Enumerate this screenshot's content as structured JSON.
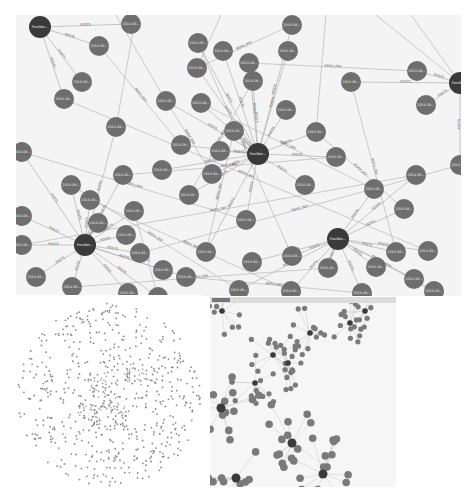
{
  "figure": {
    "colors": {
      "hub_node": "#3a3a3a",
      "leaf_node": "#6e6e6e",
      "edge": "#b8b8b8",
      "edge_label": "#555555",
      "node_label": "#e8e8e8",
      "background": "#f4f4f4"
    }
  },
  "top_panel": {
    "edge_labels": [
      "POSTS",
      "REPLY_REF"
    ],
    "hubs": [
      {
        "id": "h1",
        "label": "PostNat...",
        "x": 24,
        "y": 12,
        "r": 11
      },
      {
        "id": "h2",
        "label": "PostNat...",
        "x": 242,
        "y": 139,
        "r": 11
      },
      {
        "id": "h3",
        "label": "PostNat...",
        "x": 69,
        "y": 230,
        "r": 11
      },
      {
        "id": "h4",
        "label": "PostNat...",
        "x": 322,
        "y": 224,
        "r": 11
      },
      {
        "id": "h5",
        "label": "PostNat...",
        "x": 444,
        "y": 68,
        "r": 11
      }
    ],
    "nodes": [
      {
        "label": "2014-08...",
        "x": 83,
        "y": 31
      },
      {
        "label": "2014-08...",
        "x": 66,
        "y": 67
      },
      {
        "label": "2014-08...",
        "x": 48,
        "y": 84
      },
      {
        "label": "2014-08...",
        "x": 150,
        "y": 86
      },
      {
        "label": "2014-08...",
        "x": 100,
        "y": 112
      },
      {
        "label": "2014-08...",
        "x": 165,
        "y": 130
      },
      {
        "label": "2014-08...",
        "x": 182,
        "y": 28
      },
      {
        "label": "2014-08...",
        "x": 207,
        "y": 36
      },
      {
        "label": "2014-08...",
        "x": 181,
        "y": 53
      },
      {
        "label": "2014-08...",
        "x": 276,
        "y": 10
      },
      {
        "label": "2014-08...",
        "x": 272,
        "y": 36
      },
      {
        "label": "2014-08...",
        "x": 233,
        "y": 48
      },
      {
        "label": "2014-08...",
        "x": 185,
        "y": 88
      },
      {
        "label": "2014-08...",
        "x": 115,
        "y": 9
      },
      {
        "label": "2014-08...",
        "x": 237,
        "y": 66
      },
      {
        "label": "2014-08...",
        "x": 335,
        "y": 67
      },
      {
        "label": "2014-08...",
        "x": 270,
        "y": 95
      },
      {
        "label": "2014-08...",
        "x": 300,
        "y": 117
      },
      {
        "label": "2014-08...",
        "x": 401,
        "y": 56
      },
      {
        "label": "2014-08...",
        "x": 410,
        "y": 90
      },
      {
        "label": "2014-08...",
        "x": 218,
        "y": 116
      },
      {
        "label": "2014-08...",
        "x": 320,
        "y": 142
      },
      {
        "label": "2014-08...",
        "x": 146,
        "y": 155
      },
      {
        "label": "2014-08...",
        "x": 55,
        "y": 170
      },
      {
        "label": "2014-08...",
        "x": 74,
        "y": 185
      },
      {
        "label": "2014-08...",
        "x": 204,
        "y": 136
      },
      {
        "label": "2014-08...",
        "x": 196,
        "y": 159
      },
      {
        "label": "2014-08...",
        "x": 173,
        "y": 180
      },
      {
        "label": "2014-08...",
        "x": 289,
        "y": 170
      },
      {
        "label": "2014-08...",
        "x": 358,
        "y": 174
      },
      {
        "label": "2014-08...",
        "x": 6,
        "y": 137
      },
      {
        "label": "2014-08...",
        "x": 82,
        "y": 208
      },
      {
        "label": "2014-08...",
        "x": 107,
        "y": 160
      },
      {
        "label": "2014-08...",
        "x": 118,
        "y": 196
      },
      {
        "label": "2014-08...",
        "x": 110,
        "y": 220
      },
      {
        "label": "2014-08...",
        "x": 230,
        "y": 205
      },
      {
        "label": "2014-08...",
        "x": 388,
        "y": 194
      },
      {
        "label": "2014-08...",
        "x": 6,
        "y": 201
      },
      {
        "label": "2014-08...",
        "x": 400,
        "y": 160
      },
      {
        "label": "2014-08...",
        "x": 6,
        "y": 230
      },
      {
        "label": "2014-08...",
        "x": 20,
        "y": 262
      },
      {
        "label": "2014-08...",
        "x": 56,
        "y": 272
      },
      {
        "label": "2014-08...",
        "x": 124,
        "y": 238
      },
      {
        "label": "2014-08...",
        "x": 147,
        "y": 255
      },
      {
        "label": "2014-08...",
        "x": 170,
        "y": 262
      },
      {
        "label": "2014-08...",
        "x": 190,
        "y": 237
      },
      {
        "label": "2014-08...",
        "x": 236,
        "y": 247
      },
      {
        "label": "2014-08...",
        "x": 276,
        "y": 241
      },
      {
        "label": "2014-08...",
        "x": 312,
        "y": 253
      },
      {
        "label": "2014-08...",
        "x": 360,
        "y": 252
      },
      {
        "label": "2014-08...",
        "x": 380,
        "y": 237
      },
      {
        "label": "2014-08...",
        "x": 412,
        "y": 236
      },
      {
        "label": "2014-08...",
        "x": 398,
        "y": 264
      },
      {
        "label": "2014-08...",
        "x": 275,
        "y": 276
      },
      {
        "label": "2014-08...",
        "x": 223,
        "y": 275
      },
      {
        "label": "2014-08...",
        "x": 112,
        "y": 278
      },
      {
        "label": "2014-08...",
        "x": 142,
        "y": 282
      },
      {
        "label": "2014-08...",
        "x": 346,
        "y": 278
      },
      {
        "label": "2014-08...",
        "x": 418,
        "y": 276
      },
      {
        "label": "2014-08...",
        "x": 444,
        "y": 150
      }
    ]
  },
  "bottom_left_panel": {
    "title": "",
    "description": "Dense circular scatter of small nodes (zoomed-out full graph)",
    "node_count_visible": 600,
    "layout": "circle",
    "center": [
      95,
      100
    ],
    "radius": 92
  },
  "bottom_right_panel": {
    "description": "Zoomed-out view with multiple hub clusters",
    "hubs": [
      {
        "x": 12,
        "y": 8
      },
      {
        "x": 155,
        "y": 8
      },
      {
        "x": 100,
        "y": 30
      },
      {
        "x": 63,
        "y": 52
      },
      {
        "x": 45,
        "y": 80
      },
      {
        "x": 78,
        "y": 60
      },
      {
        "x": 140,
        "y": 20
      },
      {
        "x": 11,
        "y": 105
      },
      {
        "x": 82,
        "y": 140
      },
      {
        "x": 26,
        "y": 175
      },
      {
        "x": 113,
        "y": 171
      }
    ]
  }
}
